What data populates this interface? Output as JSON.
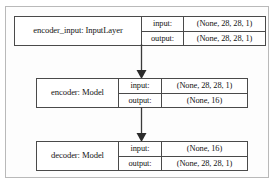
{
  "diagram": {
    "type": "layer-graph",
    "colors": {
      "box_border": "#4a4a4a",
      "frame_border": "#b9b9b9",
      "edge": "#3a3a3a",
      "background": "#ffffff",
      "text": "#141414"
    },
    "io_labels": {
      "input": "input:",
      "output": "output:"
    },
    "nodes": [
      {
        "id": "encoder_input",
        "name": "encoder_input: InputLayer",
        "input_label": "input:",
        "input_shape": "(None, 28, 28, 1)",
        "output_label": "output:",
        "output_shape": "(None, 28, 28, 1)"
      },
      {
        "id": "encoder",
        "name": "encoder: Model",
        "input_label": "input:",
        "input_shape": "(None, 28, 28, 1)",
        "output_label": "output:",
        "output_shape": "(None, 16)"
      },
      {
        "id": "decoder",
        "name": "decoder: Model",
        "input_label": "input:",
        "input_shape": "(None, 16)",
        "output_label": "output:",
        "output_shape": "(None, 28, 28, 1)"
      }
    ],
    "edges": [
      {
        "id": "edge-1",
        "from": "encoder_input",
        "to": "encoder"
      },
      {
        "id": "edge-2",
        "from": "encoder",
        "to": "decoder"
      }
    ]
  }
}
